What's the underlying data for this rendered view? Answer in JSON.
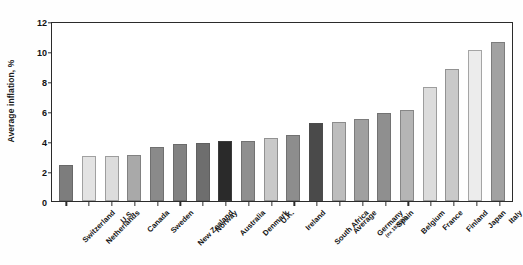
{
  "chart_data": {
    "type": "bar",
    "title": "",
    "xlabel": "",
    "ylabel": "Average inflation, %",
    "ylim": [
      0,
      12
    ],
    "yticks": [
      0,
      2,
      4,
      6,
      8,
      10,
      12
    ],
    "grid": false,
    "legend": false,
    "categories": [
      "Switzerland",
      "Netherlands",
      "U.S.",
      "Canada",
      "Sweden",
      "New Zealand",
      "Norway",
      "Australia",
      "Denmark",
      "U.K.",
      "Ireland",
      "South Africa",
      "Average",
      "Germany",
      "Spain",
      "Belgium",
      "France",
      "Finland",
      "Japan",
      "Italy"
    ],
    "category_notes": {
      "Germany": "(ex 1922/23)"
    },
    "values": [
      2.4,
      3.0,
      3.0,
      3.1,
      3.6,
      3.8,
      3.9,
      4.0,
      4.0,
      4.2,
      4.4,
      5.2,
      5.3,
      5.5,
      5.9,
      6.1,
      7.6,
      8.8,
      10.1,
      10.6
    ],
    "bar_colors": [
      "#7d7d7d",
      "#e3e3e3",
      "#dcdcdc",
      "#a9a9a9",
      "#8a8a8a",
      "#828282",
      "#6e6e6e",
      "#2a2a2a",
      "#8f8f8f",
      "#c9c9c9",
      "#8d8d8d",
      "#4a4a4a",
      "#bdbdbd",
      "#a0a0a0",
      "#8f8f8f",
      "#b5b5b5",
      "#dcdcdc",
      "#c9c9c9",
      "#ececec",
      "#a2a2a2"
    ]
  },
  "axis": {
    "y_title": "Average inflation, %"
  }
}
